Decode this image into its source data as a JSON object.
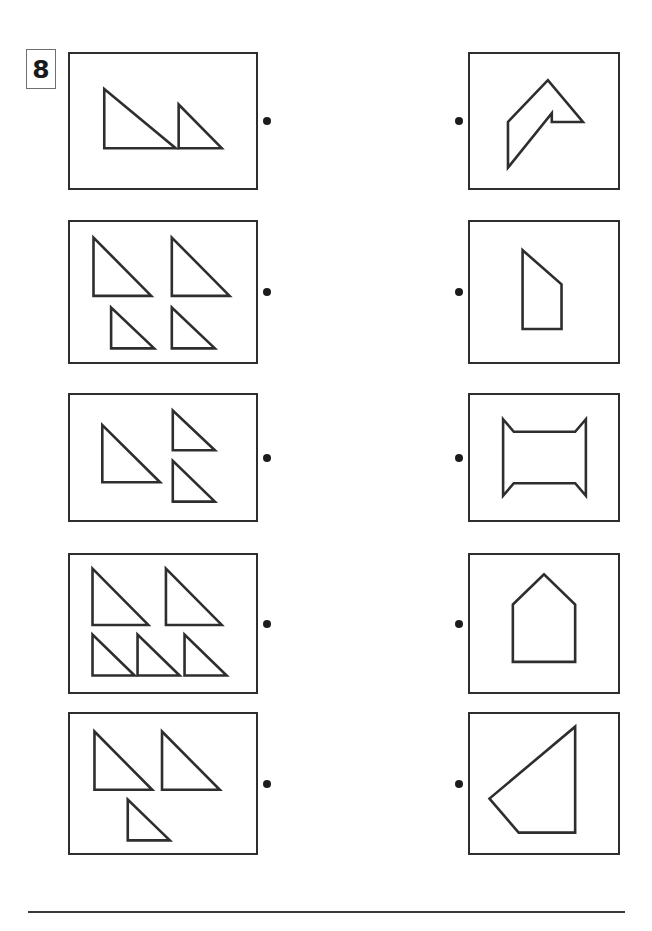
{
  "worksheet": {
    "exercise_number": "8",
    "page_width": 652,
    "page_height": 931,
    "ink_color": "#2e2e2e",
    "dot_color": "#1c1c1c",
    "badge_border_color": "#6f6f6f",
    "background_color": "#ffffff",
    "task_type": "match-triangles-to-composite-shape",
    "footer_rule": {
      "x": 28,
      "y": 911,
      "width": 597,
      "height": 2
    }
  },
  "layout": {
    "left_panel_x": 68,
    "left_panel_width": 190,
    "right_panel_x": 468,
    "right_panel_width": 152,
    "left_dot_x": 263,
    "right_dot_x": 455
  },
  "rows": [
    {
      "id": "row-1",
      "top": 52,
      "height": 138,
      "left_panel": {
        "name": "triangle-set-1",
        "triangle_count": 2,
        "viewbox": "0 0 190 138",
        "shapes": [
          {
            "name": "triangle-large",
            "points": "35,36 35,97 108,97"
          },
          {
            "name": "triangle-small",
            "points": "111,52 111,97 155,97"
          }
        ]
      },
      "right_panel": {
        "name": "composite-shape-1",
        "shape_label": "arrow-flag-polygon",
        "viewbox": "0 0 152 138",
        "points": "39,70 80,27 116,70 84,70 84,61 39,117"
      }
    },
    {
      "id": "row-2",
      "top": 220,
      "height": 144,
      "left_panel": {
        "name": "triangle-set-2",
        "triangle_count": 4,
        "viewbox": "0 0 190 144",
        "shapes": [
          {
            "name": "triangle-top-left",
            "points": "24,16 24,76 83,76"
          },
          {
            "name": "triangle-top-right",
            "points": "104,16 104,76 163,76"
          },
          {
            "name": "triangle-bottom-left",
            "points": "42,88 42,130 86,130"
          },
          {
            "name": "triangle-bottom-right",
            "points": "104,88 104,130 148,130"
          }
        ]
      },
      "right_panel": {
        "name": "composite-shape-2",
        "shape_label": "right-trapezoid",
        "viewbox": "0 0 152 144",
        "points": "54,29 54,110 94,110 94,64"
      }
    },
    {
      "id": "row-3",
      "top": 393,
      "height": 129,
      "left_panel": {
        "name": "triangle-set-3",
        "triangle_count": 3,
        "viewbox": "0 0 190 129",
        "shapes": [
          {
            "name": "triangle-large-left",
            "points": "33,31 33,90 92,90"
          },
          {
            "name": "triangle-small-top-right",
            "points": "105,16 105,57 148,57"
          },
          {
            "name": "triangle-small-bottom-right",
            "points": "105,68 105,110 148,110"
          }
        ]
      },
      "right_panel": {
        "name": "composite-shape-3",
        "shape_label": "concave-hourglass-square",
        "viewbox": "0 0 152 129",
        "points": "34,25 45,38 108,38 119,25 119,104 108,91 45,91 34,104"
      }
    },
    {
      "id": "row-4",
      "top": 553,
      "height": 141,
      "left_panel": {
        "name": "triangle-set-4",
        "triangle_count": 5,
        "viewbox": "0 0 190 141",
        "shapes": [
          {
            "name": "triangle-top-left",
            "points": "23,14 23,72 80,72"
          },
          {
            "name": "triangle-top-right",
            "points": "98,14 98,72 155,72"
          },
          {
            "name": "triangle-bottom-left",
            "points": "23,82 23,124 66,124"
          },
          {
            "name": "triangle-bottom-middle",
            "points": "69,82 69,124 112,124"
          },
          {
            "name": "triangle-bottom-right",
            "points": "117,82 117,124 160,124"
          }
        ]
      },
      "right_panel": {
        "name": "composite-shape-4",
        "shape_label": "house-pentagon",
        "viewbox": "0 0 152 141",
        "points": "44,51 76,20 108,51 108,110 44,110"
      }
    },
    {
      "id": "row-5",
      "top": 712,
      "height": 143,
      "left_panel": {
        "name": "triangle-set-5",
        "triangle_count": 3,
        "viewbox": "0 0 190 143",
        "shapes": [
          {
            "name": "triangle-top-left",
            "points": "25,18 25,78 84,78"
          },
          {
            "name": "triangle-top-right",
            "points": "94,18 94,78 153,78"
          },
          {
            "name": "triangle-bottom-middle",
            "points": "59,88 59,130 102,130"
          }
        ]
      },
      "right_panel": {
        "name": "composite-shape-5",
        "shape_label": "kite-triangle-polygon",
        "viewbox": "0 0 152 143",
        "points": "108,13 108,122 50,122 20,87"
      }
    }
  ]
}
